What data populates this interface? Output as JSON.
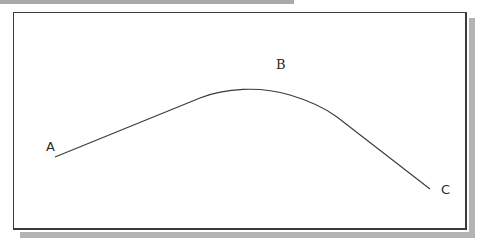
{
  "diagram": {
    "points": [
      {
        "label": "A",
        "x": 55,
        "y": 157
      },
      {
        "label": "B",
        "x": 255,
        "y": 90
      },
      {
        "label": "C",
        "x": 430,
        "y": 189
      }
    ],
    "path": "M55,157 L200,98 C225,88 260,86 290,95 C310,101 325,108 337,117 L430,189",
    "colors": {
      "stroke": "#3a3a3a",
      "frame": "#3a3a3a",
      "shadow": "#b3b3b3",
      "band": "#a9a9a9",
      "background": "#ffffff"
    }
  }
}
